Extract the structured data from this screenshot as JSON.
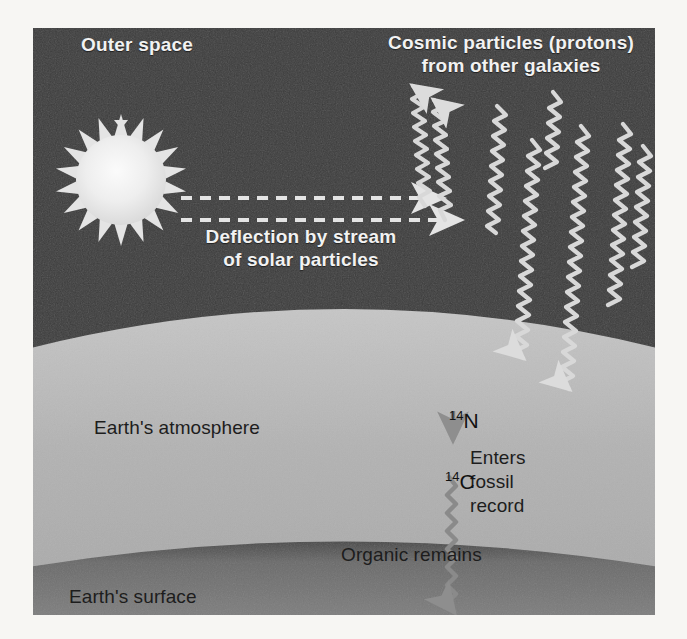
{
  "figure": {
    "title_semantic": "Formation of carbon-14 in Earth's atmosphere",
    "background_color": "#f7f6f3",
    "space_color": "#3c3c3c",
    "atmosphere_color": "#b4b4b4",
    "surface_color": "#6e6e6e",
    "sun_color": "#e6e6e6",
    "ray_color": "#d8d8d8",
    "dark_text_color": "#1d1d1d",
    "light_text_color": "#f2f2f2"
  },
  "labels": {
    "outer_space": "Outer space",
    "cosmic_particles_line1": "Cosmic particles (protons)",
    "cosmic_particles_line2": "from other galaxies",
    "deflection_line1": "Deflection by stream",
    "deflection_line2": "of solar particles",
    "atmosphere": "Earth's atmosphere",
    "surface": "Earth's surface",
    "organic_remains": "Organic remains",
    "enters_line1": "Enters",
    "enters_line2": "fossil",
    "enters_line3": "record"
  },
  "isotopes": {
    "nitrogen_mass": "14",
    "nitrogen_symbol": "N",
    "carbon_mass": "14",
    "carbon_symbol": "C"
  },
  "elements": {
    "sun_name": "sun",
    "solar_wind_arrow_count": 2,
    "cosmic_ray_count": 6,
    "deflected_ray_count": 2
  }
}
